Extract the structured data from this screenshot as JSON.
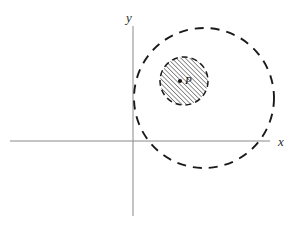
{
  "figure": {
    "background_color": "#ffffff",
    "width": 295,
    "height": 239
  },
  "axes": {
    "x_axis": {
      "label": "x",
      "label_x": 278,
      "label_y": 146,
      "color": "#8a8a8a",
      "stroke_width": 1,
      "x_start": 10,
      "x_end": 270,
      "y": 141
    },
    "y_axis": {
      "label": "y",
      "label_x": 126,
      "label_y": 22,
      "color": "#8a8a8a",
      "stroke_width": 1,
      "x": 133,
      "y_start": 26,
      "y_end": 216
    },
    "origin": {
      "x": 133,
      "y": 141
    }
  },
  "shapes": {
    "outer_circle": {
      "name": "outer-dashed-circle",
      "center_x": 204,
      "center_y": 98,
      "radius": 70,
      "stroke": "#1a1a1a",
      "stroke_width": 1.9,
      "dash": "9 7",
      "fill": "none"
    },
    "inner_circle": {
      "name": "inner-hatched-circle",
      "center_x": 184,
      "center_y": 81,
      "radius": 24,
      "stroke": "#1a1a1a",
      "stroke_width": 1.5,
      "dash": "6 4",
      "fill": "hatch-pattern",
      "hatch_angle_deg": 45,
      "hatch_spacing": 3.2,
      "hatch_color": "#1a1a1a"
    },
    "point": {
      "name": "point-P",
      "label": "P",
      "cx": 180,
      "cy": 81,
      "radius": 2.1,
      "color": "#111111",
      "label_x": 185,
      "label_y": 84
    }
  }
}
